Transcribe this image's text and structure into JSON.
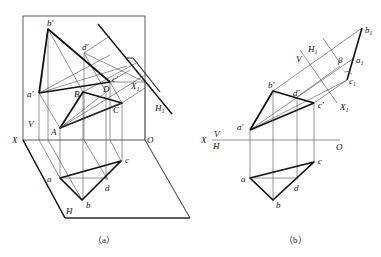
{
  "figure": {
    "panel_a": {
      "caption": "（a）",
      "labels": {
        "b_prime": "b′",
        "d_prime": "d′",
        "c_prime": "c′",
        "a_prime": "a′",
        "B": "B",
        "D": "D",
        "C": "C",
        "A": "A",
        "V": "V",
        "X": "X",
        "O": "O",
        "H": "H",
        "a": "a",
        "b": "b",
        "c": "c",
        "d": "d",
        "X1": "X",
        "X1_sub": "1",
        "H1": "H",
        "H1_sub": "1"
      }
    },
    "panel_b": {
      "caption": "（b）",
      "labels": {
        "b1": "b",
        "b1_sub": "1",
        "a1": "a",
        "a1_sub": "1",
        "c1": "c",
        "c1_sub": "1",
        "V1": "V",
        "H1": "H",
        "H1_sub": "1",
        "beta": "β",
        "X1": "X",
        "X1_sub": "1",
        "b_prime": "b′",
        "d_prime": "d′",
        "c_prime": "c′",
        "a_prime": "a′",
        "X": "X",
        "V": "V",
        "H": "H",
        "O": "O",
        "a": "a",
        "b": "b",
        "c": "c",
        "d": "d"
      }
    }
  }
}
